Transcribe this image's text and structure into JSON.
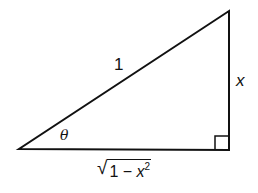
{
  "diagram": {
    "type": "right-triangle",
    "vertices": {
      "angle_vertex": [
        19,
        149
      ],
      "right_angle_vertex": [
        229,
        150
      ],
      "top_vertex": [
        229,
        11
      ]
    },
    "labels": {
      "hypotenuse": "1",
      "opposite": "x",
      "angle": "θ",
      "adjacent_sqrt_sign": "√",
      "adjacent_radicand_prefix": "1 − ",
      "adjacent_var": "x",
      "adjacent_exponent": "2"
    },
    "right_angle_marker": true,
    "stroke_color": "#111111",
    "background": "#ffffff"
  }
}
